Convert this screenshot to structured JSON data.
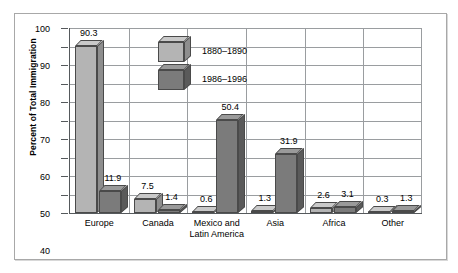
{
  "chart_data": {
    "type": "bar",
    "title": "",
    "xlabel": "",
    "ylabel": "Percent of Total Immigration",
    "ylim": [
      0,
      100
    ],
    "ytick_step": 10,
    "grid": true,
    "legend_position": "inside-top-left",
    "categories": [
      "Europe",
      "Canada",
      "Mexico and Latin America",
      "Asia",
      "Africa",
      "Other"
    ],
    "series": [
      {
        "name": "1880–1890",
        "color": "#b4b4b4",
        "values": [
          90.3,
          7.5,
          0.6,
          1.3,
          2.6,
          0.3
        ]
      },
      {
        "name": "1986–1996",
        "color": "#7b7b7b",
        "values": [
          11.9,
          1.4,
          50.4,
          31.9,
          3.1,
          1.3
        ]
      }
    ],
    "yticks": [
      "100",
      "90",
      "80",
      "70",
      "60",
      "50",
      "40",
      "30",
      "20",
      "10",
      "0"
    ],
    "data_labels": [
      [
        "90.3",
        "11.9"
      ],
      [
        "7.5",
        "1.4"
      ],
      [
        "0.6",
        "50.4"
      ],
      [
        "1.3",
        "31.9"
      ],
      [
        "2.6",
        "3.1"
      ],
      [
        "0.3",
        "1.3"
      ]
    ],
    "xtick_lines": [
      [
        "Europe"
      ],
      [
        "Canada"
      ],
      [
        "Mexico and",
        "Latin America"
      ],
      [
        "Asia"
      ],
      [
        "Africa"
      ],
      [
        "Other"
      ]
    ]
  }
}
